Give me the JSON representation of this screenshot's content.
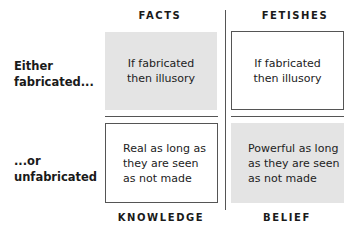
{
  "columns": [
    {
      "header": "FACTS",
      "footer": "KNOWLEDGE"
    },
    {
      "header": "FETISHES",
      "footer": "BELIEF"
    }
  ],
  "rows": [
    {
      "label_line1": "Either",
      "label_line2": "fabricated..."
    },
    {
      "label_line1": "...or",
      "label_line2": "unfabricated"
    }
  ],
  "cells": {
    "facts_fabricated": {
      "line1": "If fabricated",
      "line2": "then illusory",
      "style": "shaded"
    },
    "fetishes_fabricated": {
      "line1": "If fabricated",
      "line2": "then illusory",
      "style": "boxed"
    },
    "facts_unfabricated": {
      "line1": "Real as long as",
      "line2": "they are seen",
      "line3": "as not made",
      "style": "boxed"
    },
    "fetishes_unfabricated": {
      "line1": "Powerful as long",
      "line2": "as they are seen",
      "line3": "as not made",
      "style": "shaded"
    }
  },
  "colors": {
    "shade": "#e4e4e4",
    "line": "#555555"
  }
}
